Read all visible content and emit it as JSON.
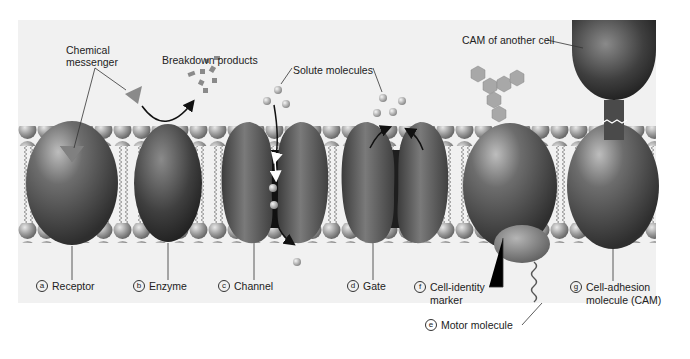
{
  "figure": {
    "top_labels": {
      "chemical_messenger": [
        "Chemical",
        "messenger"
      ],
      "breakdown_products": "Breakdown products",
      "solute_molecules": "Solute molecules",
      "cam_other_cell": "CAM of another cell"
    },
    "proteins": [
      {
        "letter": "a",
        "label": "Receptor"
      },
      {
        "letter": "b",
        "label": "Enzyme"
      },
      {
        "letter": "c",
        "label": "Channel"
      },
      {
        "letter": "d",
        "label": "Gate"
      },
      {
        "letter": "f",
        "label": "Cell-identity",
        "label2": "marker"
      },
      {
        "letter": "e",
        "label": "Motor molecule"
      },
      {
        "letter": "g",
        "label": "Cell-adhesion",
        "label2": "molecule (CAM)"
      }
    ]
  }
}
